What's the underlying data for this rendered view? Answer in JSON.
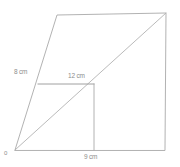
{
  "figure": {
    "background_color": "#ffffff",
    "line_color": "#a9a9a9",
    "label_color": "#8d8d8d",
    "labels": {
      "origin": "0",
      "left_side": "8 cm",
      "middle_horizontal": "12 cm",
      "base": "9 cm"
    },
    "measurements": [
      {
        "name": "left-side-segment",
        "value": 8,
        "unit": "cm",
        "text": "8 cm"
      },
      {
        "name": "middle-horizontal-segment",
        "value": 12,
        "unit": "cm",
        "text": "12 cm"
      },
      {
        "name": "base-segment",
        "value": 9,
        "unit": "cm",
        "text": "9 cm"
      }
    ],
    "vertices": {
      "origin": [
        15,
        150
      ],
      "top_left": [
        57,
        15
      ],
      "top_right": [
        166,
        13
      ],
      "bottom_right": [
        165,
        150
      ],
      "inner_corner": [
        94,
        84
      ],
      "left_edge_point": [
        38,
        84
      ],
      "base_tick": [
        94,
        150
      ]
    },
    "paths": {
      "outline": "M 15 150 L 57 15 L 166 13 L 165 150 Z",
      "diagonal": "M 15 150 L 166 13",
      "horizontal_segment": "M 38 84 L 94 84",
      "vertical_segment": "M 94 84 L 94 150"
    }
  }
}
